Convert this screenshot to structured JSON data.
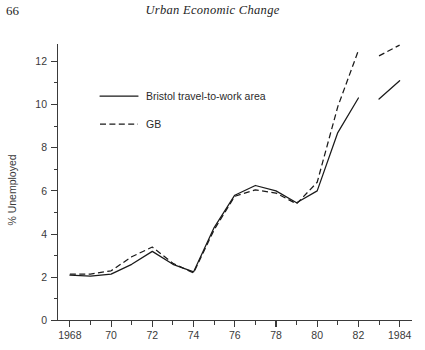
{
  "page": {
    "number": "66",
    "running_head": "Urban Economic Change"
  },
  "chart_data": {
    "type": "line",
    "title": "",
    "xlabel": "",
    "ylabel": "% Unemployed",
    "xlim": [
      1967.4,
      1984.6
    ],
    "ylim": [
      0,
      12.8
    ],
    "grid": false,
    "legend_position": "upper-left-inside",
    "y_ticks_major": [
      0,
      2,
      4,
      6,
      8,
      10,
      12
    ],
    "y_ticks_minor": [
      1,
      3,
      5,
      7,
      9,
      11
    ],
    "y_tick_labels": [
      "0",
      "2",
      "4",
      "6",
      "8",
      "10",
      "12"
    ],
    "x_ticks_major": [
      1968,
      1970,
      1972,
      1974,
      1976,
      1978,
      1980,
      1982,
      1984
    ],
    "x_ticks_minor": [
      1969,
      1971,
      1973,
      1975,
      1977,
      1979,
      1981,
      1983
    ],
    "x_tick_labels": [
      "1968",
      "70",
      "72",
      "74",
      "76",
      "78",
      "80",
      "82",
      "1984"
    ],
    "series": [
      {
        "name": "Bristol travel-to-work area",
        "style": "solid",
        "x": [
          1968,
          1969,
          1970,
          1971,
          1972,
          1973,
          1974,
          1975,
          1976,
          1977,
          1978,
          1979,
          1980,
          1981,
          1982
        ],
        "values": [
          2.1,
          2.05,
          2.15,
          2.6,
          3.2,
          2.6,
          2.25,
          4.3,
          5.8,
          6.25,
          6.0,
          5.45,
          6.0,
          8.7,
          10.3
        ]
      },
      {
        "name": "Bristol travel-to-work area",
        "style": "solid",
        "segment": "post-break",
        "x": [
          1983,
          1984
        ],
        "values": [
          10.25,
          11.1
        ]
      },
      {
        "name": "GB",
        "style": "dashed",
        "x": [
          1968,
          1969,
          1970,
          1971,
          1972,
          1973,
          1974,
          1975,
          1976,
          1977,
          1978,
          1979,
          1980,
          1981,
          1982
        ],
        "values": [
          2.15,
          2.15,
          2.3,
          2.95,
          3.4,
          2.65,
          2.2,
          4.2,
          5.75,
          6.05,
          5.9,
          5.4,
          6.4,
          9.9,
          12.5
        ]
      },
      {
        "name": "GB",
        "style": "dashed",
        "segment": "post-break",
        "x": [
          1983,
          1984
        ],
        "values": [
          12.25,
          12.75
        ]
      }
    ],
    "legend": [
      {
        "label": "Bristol travel-to-work area",
        "style": "solid"
      },
      {
        "label": "GB",
        "style": "dashed"
      }
    ]
  }
}
